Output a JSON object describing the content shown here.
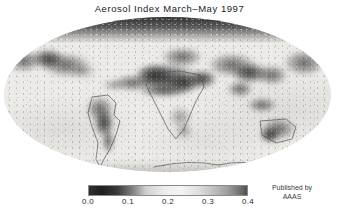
{
  "figure": {
    "title": "Aerosol Index  March–May 1997",
    "background_color": "#ffffff"
  },
  "map": {
    "projection_name": "mollweide-ellipse",
    "field_label": "aerosol-index-field",
    "ocean_color": "#ECEAE7",
    "land_outline_color": "#4a4a4a",
    "high_value_color": "#262626"
  },
  "colorbar": {
    "name": "aerosol-index-colorbar",
    "orientation": "horizontal",
    "min": 0.0,
    "max": 0.4,
    "low_color": "#1f1f1f",
    "mid_color": "#f4f4f4",
    "high_color": "#4f4f4f",
    "ticks": [
      {
        "label": "0.0",
        "value": 0.0,
        "pos_pct": 0
      },
      {
        "label": "0.1",
        "value": 0.1,
        "pos_pct": 25
      },
      {
        "label": "0.2",
        "value": 0.2,
        "pos_pct": 50
      },
      {
        "label": "0.3",
        "value": 0.3,
        "pos_pct": 75
      },
      {
        "label": "0.4",
        "value": 0.4,
        "pos_pct": 100
      }
    ]
  },
  "credit": {
    "line1": "Published by",
    "line2": "AAAS"
  },
  "chart_data": {
    "type": "heatmap",
    "title": "Aerosol Index  March–May 1997",
    "subtitle": "",
    "xlabel": "",
    "ylabel": "",
    "projection": "Mollweide (global ellipse)",
    "colormap": "grayscale",
    "grid": false,
    "legend_position": "bottom-center",
    "colorbar_label": "Aerosol Index",
    "zlim": [
      0.0,
      0.4
    ],
    "tick_labels": [
      "0.0",
      "0.1",
      "0.2",
      "0.3",
      "0.4"
    ],
    "annotations": [
      "Published by AAAS"
    ],
    "regions": [
      {
        "name": "North Africa / Sahara",
        "value": 0.38,
        "note": "strongest dust plume"
      },
      {
        "name": "Arabian Peninsula",
        "value": 0.34
      },
      {
        "name": "Sahel / West Africa",
        "value": 0.33
      },
      {
        "name": "Tropical Atlantic dust outflow",
        "value": 0.3
      },
      {
        "name": "Central / East Asia",
        "value": 0.31
      },
      {
        "name": "India / Indo-Gangetic plain",
        "value": 0.28
      },
      {
        "name": "Amazon Basin / South America",
        "value": 0.27
      },
      {
        "name": "Southern Africa",
        "value": 0.24
      },
      {
        "name": "Australia",
        "value": 0.26
      },
      {
        "name": "North Atlantic / high northern latitudes",
        "value": 0.36
      },
      {
        "name": "Southern Ocean",
        "value": 0.06
      },
      {
        "name": "South Pacific",
        "value": 0.04
      },
      {
        "name": "South Atlantic",
        "value": 0.05
      },
      {
        "name": "Antarctic coast",
        "value": 0.12
      }
    ]
  }
}
